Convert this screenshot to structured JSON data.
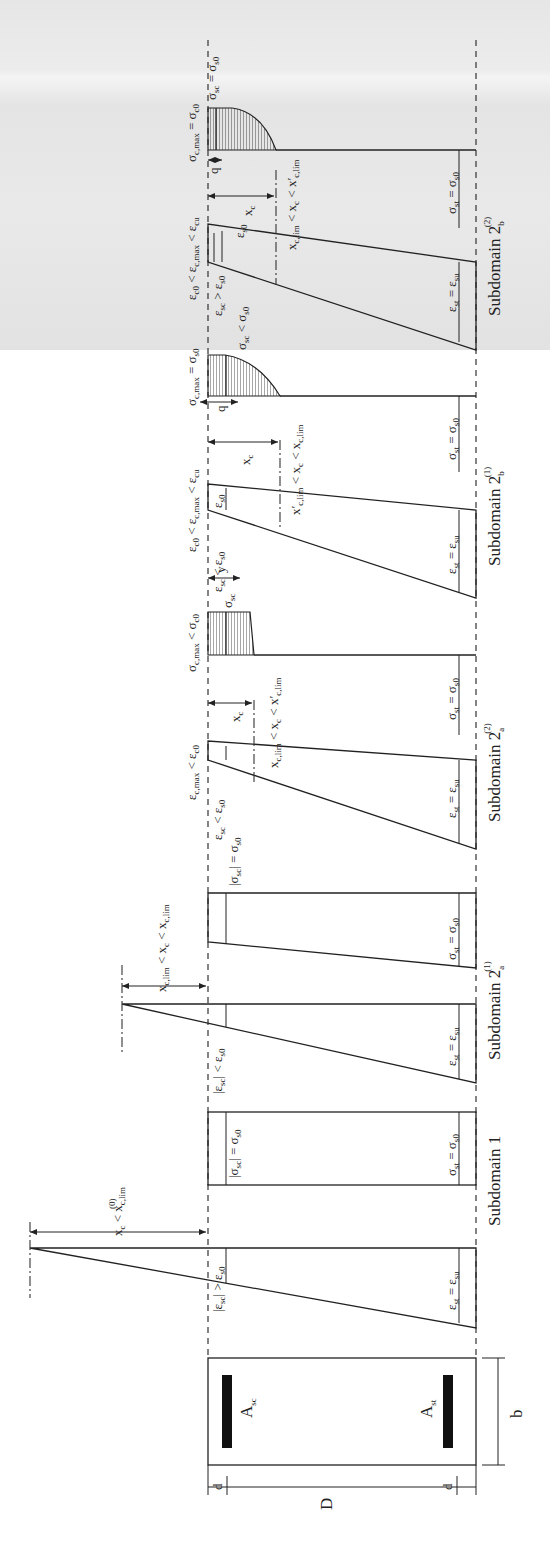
{
  "figure": {
    "section": {
      "compression_steel": "A",
      "compression_steel_sub": "sc",
      "tension_steel": "A",
      "tension_steel_sub": "st",
      "depth": "D",
      "width": "b",
      "cover_top": "d'",
      "cover_bottom": "d'"
    },
    "panels": [
      {
        "title": "Subdomain 1",
        "neutral_axis": "x_c < x_c,lim^(0)",
        "strain_top": "|ε_sc| > ε_s0",
        "strain_bottom": "ε_st = ε_su",
        "stress_top": "|σ_sc| = σ_s0",
        "stress_bottom": "σ_st = σ_s0"
      },
      {
        "title": "Subdomain 2_a^(1)",
        "neutral_axis": "x_c,lim^(0) < x_c < x_c,lim^(a)",
        "strain_top": "|ε_sc| < ε_s0",
        "strain_bottom": "ε_st = ε_su",
        "stress_top": "|σ_sc| = σ_s0",
        "stress_bottom": "σ_st = σ_s0"
      },
      {
        "title": "Subdomain 2_a^(2)",
        "neutral_axis": "x_c,lim^(a) < x_c < x'_c,lim",
        "strain_top": "ε_c,max < ε_c0",
        "strain_steel": "ε_sc < ε_s0",
        "strain_bottom": "ε_st = ε_su",
        "stress_top": "σ_c,max < σ_c0",
        "stress_steel": "σ_sc",
        "stress_bottom": "σ_st = σ_s0",
        "dim_xc": "x_c",
        "dim_y": "y"
      },
      {
        "title": "Subdomain 2_b^(1)",
        "neutral_axis": "x'_c,lim < x_c < x_c,lim^(b)",
        "strain_top": "ε_c0 < ε_c,max < ε_cu",
        "strain_steel": "ε_sc < ε_s0",
        "strain_marker": "ε_s0",
        "strain_bottom": "ε_st = ε_su",
        "stress_top": "σ_c,max = σ_s0",
        "stress_steel": "σ_sc < σ_s0",
        "stress_bottom": "σ_st = σ_s0",
        "dim_xc": "x_c",
        "dim_q": "q"
      },
      {
        "title": "Subdomain 2_b^(2)",
        "neutral_axis": "x_c,lim^(b) < x_c < x'_c,lim",
        "strain_top": "ε_c0 < ε_c,max < ε_cu",
        "strain_steel": "ε_sc > ε_s0",
        "strain_marker": "ε_s0",
        "strain_bottom": "ε_st = ε_su",
        "stress_top": "σ_c,max = σ_c0",
        "stress_steel": "σ_sc = σ_s0",
        "stress_bottom": "σ_st = σ_s0",
        "dim_xc": "x_c",
        "dim_q": "q"
      }
    ]
  },
  "labels": {
    "A": "A",
    "sc": "sc",
    "st": "st",
    "D": "D",
    "b": "b",
    "d": "d",
    "sub1": "Subdomain 1",
    "subdomain": "Subdomain 2",
    "a": "a",
    "b_sub": "b",
    "s1": "(1)",
    "s2": "(2)",
    "xc_lim0": "x  < x",
    "eps_sc_gt": "|ε  | > ε",
    "eps_sc_lt_abs": "|ε  | < ε",
    "sig_sc_eq_abs": "|σ  | = σ",
    "eps_st_su": "ε   = ε",
    "sig_st_s0": "σ   = σ",
    "eps_sc_lt": "ε   < ε",
    "eps_sc_gt2": "ε   > ε",
    "eps_cmax_lt": "ε       < ε",
    "eps_c0_range": "ε   < ε       < ε",
    "sig_cmax_lt": "σ       < σ",
    "sig_cmax_eq_s0": "σ       = σ",
    "sig_cmax_eq_c0": "σ       = σ",
    "sig_sc": "σ",
    "sig_sc_lt": "σ   < σ",
    "sig_sc_eq": "σ   = σ",
    "eps_s0": "ε",
    "xc": "x",
    "y": "y",
    "q": "q",
    "na_a1": "x      < x  < x",
    "na_a2": "x      < x  < x'",
    "na_b1": "x'      < x  < x",
    "na_b2": "x      < x  < x'"
  }
}
